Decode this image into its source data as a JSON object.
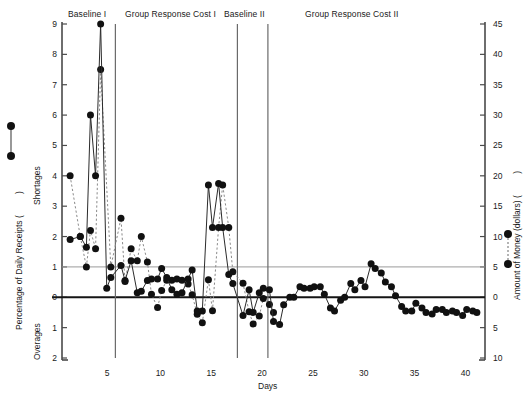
{
  "chart_data": {
    "type": "line",
    "title": "",
    "xlabel": "Days",
    "ylabel_left": "Percentage of Daily Receipts (",
    "ylabel_left_suffix": ")",
    "ylabel_left_inner_top": "Shortages",
    "ylabel_left_inner_bottom": "Overages",
    "ylabel_right": "Amount of Money (dollars) (",
    "ylabel_right_suffix": ")",
    "left_axis_ticks": [
      "9",
      "8",
      "7",
      "6",
      "5",
      "4",
      "3",
      "2",
      "1",
      "0",
      "1",
      "2"
    ],
    "left_axis_values": [
      9,
      8,
      7,
      6,
      5,
      4,
      3,
      2,
      1,
      0,
      -1,
      -2
    ],
    "right_axis_ticks": [
      "45",
      "40",
      "35",
      "30",
      "25",
      "20",
      "15",
      "10",
      "5",
      "0",
      "5",
      "10"
    ],
    "right_axis_values": [
      45,
      40,
      35,
      30,
      25,
      20,
      15,
      10,
      5,
      0,
      -5,
      -10
    ],
    "x_axis_ticks": [
      "5",
      "10",
      "15",
      "20",
      "25",
      "30",
      "35",
      "40"
    ],
    "x_axis_values": [
      5,
      10,
      15,
      20,
      25,
      30,
      35,
      40
    ],
    "xlim": [
      0.2,
      41.8
    ],
    "ylim_left": [
      -2,
      9
    ],
    "ylim_right": [
      -10,
      45
    ],
    "grid": false,
    "reference_line_left": 1,
    "reference_line_right": 5,
    "zero_line": 0,
    "legend_position": "axis-labels",
    "phases": [
      {
        "name": "Baseline I",
        "start_day": 1,
        "end_day": 5,
        "divider_after_day": 5
      },
      {
        "name": "Group Response Cost I",
        "start_day": 6,
        "end_day": 17,
        "divider_after_day": 17
      },
      {
        "name": "Baseline II",
        "start_day": 18,
        "end_day": 20,
        "divider_after_day": 20
      },
      {
        "name": "Group Response Cost II",
        "start_day": 21,
        "end_day": 41,
        "divider_after_day": null
      }
    ],
    "series": [
      {
        "name": "Percentage of Daily Receipts",
        "style": "solid",
        "axis": "left",
        "x": [
          1,
          2,
          2.6,
          3,
          3.5,
          4,
          4.6,
          5,
          6,
          6.4,
          7,
          7.6,
          8,
          8.6,
          9,
          9.6,
          10,
          10.5,
          11,
          11.5,
          12,
          12.6,
          13,
          13.5,
          14,
          14.6,
          15,
          15.6,
          16,
          16.6,
          17,
          18,
          18.6,
          19,
          19.6,
          20,
          20.6,
          21,
          21.6,
          22,
          22.6,
          23,
          23.6,
          24,
          24.6,
          25,
          25.6,
          26,
          26.6,
          27,
          27.6,
          28,
          28.6,
          29,
          29.6,
          30,
          30.6,
          31,
          31.6,
          32,
          32.6,
          33,
          33.6,
          34,
          34.6,
          35,
          35.6,
          36,
          36.6,
          37,
          37.6,
          38,
          38.6,
          39,
          39.6,
          40,
          40.6,
          41
        ],
        "y": [
          1.9,
          2.0,
          1.65,
          6.0,
          4.0,
          9.0,
          0.3,
          0.65,
          1.05,
          0.55,
          1.2,
          0.15,
          0.2,
          0.55,
          0.6,
          0.6,
          0.95,
          0.65,
          0.25,
          0.1,
          0.15,
          0.6,
          0.9,
          -0.45,
          -0.45,
          3.7,
          2.3,
          3.75,
          2.3,
          0.75,
          0.45,
          -0.6,
          0.25,
          -0.5,
          0.15,
          0.3,
          0.25,
          -0.8,
          -0.9,
          -0.25,
          0.0,
          0.0,
          0.35,
          0.3,
          0.3,
          0.35,
          0.35,
          0.1,
          -0.35,
          -0.45,
          -0.1,
          0.0,
          0.45,
          0.25,
          0.55,
          0.35,
          1.1,
          0.95,
          0.8,
          0.5,
          0.35,
          0.05,
          -0.3,
          -0.45,
          -0.45,
          -0.2,
          -0.35,
          -0.5,
          -0.55,
          -0.4,
          -0.4,
          -0.5,
          -0.45,
          -0.5,
          -0.6,
          -0.4,
          -0.45,
          -0.5
        ]
      },
      {
        "name": "Amount of Money (dollars)",
        "style": "dashed",
        "axis": "right",
        "x": [
          1,
          2,
          2.6,
          3,
          3.5,
          4,
          5,
          6,
          6.4,
          7,
          7.6,
          8,
          8.6,
          9,
          9.6,
          10,
          10.5,
          11,
          11.5,
          12,
          12.6,
          13,
          13.5,
          14,
          14.6,
          15,
          15.6,
          16,
          16.6,
          17,
          18,
          18.6,
          19,
          19.6,
          20,
          20.6,
          21
        ],
        "y": [
          20,
          10,
          5,
          11,
          8,
          37.5,
          5,
          13,
          2.6,
          8,
          6,
          10,
          5.8,
          0.5,
          -1.7,
          1.1,
          2.8,
          2.8,
          3.0,
          2.8,
          2.2,
          0.4,
          -2.8,
          -4.2,
          2.9,
          -2.2,
          11.5,
          18.5,
          11.5,
          4.2,
          2.3,
          -2.4,
          -4.4,
          -3.1,
          -0.2,
          -1.2,
          -2.5
        ]
      }
    ]
  },
  "icons": {
    "solid_series_marker": "filled-circle-solid-line",
    "dashed_series_marker": "filled-circle-dashed-line"
  }
}
